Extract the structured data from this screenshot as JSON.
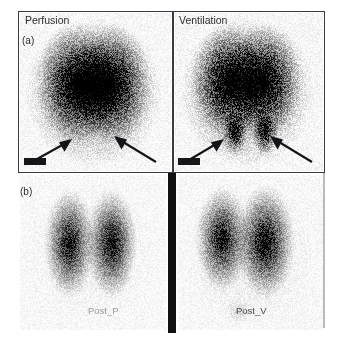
{
  "figure": {
    "panels": {
      "a": {
        "tag": "(a)",
        "left_title": "Perfusion",
        "right_title": "Ventilation"
      },
      "b": {
        "tag": "(b)",
        "left_caption": "Post_P",
        "right_caption": "Post_V"
      }
    },
    "colors": {
      "frame": "#3a3a42",
      "divider": "#111114",
      "ink": "#2b2b30",
      "caption_light": "#9a9aa2",
      "caption_dark": "#4a4a52",
      "background": "#ffffff",
      "marker": "#17171b"
    },
    "annotations": {
      "arrow_perfusion_left": "arrow-up-right",
      "arrow_perfusion_right": "arrow-up-left",
      "arrow_ventilation_left": "arrow-up-right",
      "arrow_ventilation_right": "arrow-up-left"
    },
    "scans": {
      "perfusion_top": {
        "modality": "perfusion",
        "view": "posterior",
        "lungs": [
          {
            "cx": 0.365,
            "cy": 0.45,
            "rx": 0.175,
            "ry": 0.255,
            "intensity": 1.0
          },
          {
            "cx": 0.605,
            "cy": 0.45,
            "rx": 0.175,
            "ry": 0.255,
            "intensity": 1.0
          }
        ],
        "hotspots": [],
        "background_halo": 0.34,
        "noise": 0.55
      },
      "ventilation_top": {
        "modality": "ventilation",
        "view": "posterior",
        "lungs": [
          {
            "cx": 0.355,
            "cy": 0.43,
            "rx": 0.17,
            "ry": 0.245,
            "intensity": 1.0
          },
          {
            "cx": 0.6,
            "cy": 0.43,
            "rx": 0.17,
            "ry": 0.245,
            "intensity": 1.0
          }
        ],
        "hotspots": [
          {
            "cx": 0.4,
            "cy": 0.76,
            "rx": 0.058,
            "ry": 0.095,
            "intensity": 0.85
          },
          {
            "cx": 0.605,
            "cy": 0.76,
            "rx": 0.058,
            "ry": 0.095,
            "intensity": 0.82
          }
        ],
        "background_halo": 0.34,
        "noise": 0.6
      },
      "perfusion_bottom": {
        "modality": "perfusion",
        "view": "posterior",
        "lungs": [
          {
            "cx": 0.335,
            "cy": 0.44,
            "rx": 0.115,
            "ry": 0.235,
            "intensity": 0.95
          },
          {
            "cx": 0.625,
            "cy": 0.44,
            "rx": 0.115,
            "ry": 0.235,
            "intensity": 0.97
          }
        ],
        "hotspots": [],
        "background_halo": 0.05,
        "noise": 0.42
      },
      "ventilation_bottom": {
        "modality": "ventilation",
        "view": "posterior",
        "lungs": [
          {
            "cx": 0.3,
            "cy": 0.41,
            "rx": 0.12,
            "ry": 0.225,
            "intensity": 0.96
          },
          {
            "cx": 0.6,
            "cy": 0.43,
            "rx": 0.135,
            "ry": 0.245,
            "intensity": 1.0
          }
        ],
        "hotspots": [
          {
            "cx": 0.42,
            "cy": 0.88,
            "rx": 0.07,
            "ry": 0.06,
            "intensity": 0.14
          }
        ],
        "background_halo": 0.07,
        "noise": 0.46
      }
    }
  }
}
